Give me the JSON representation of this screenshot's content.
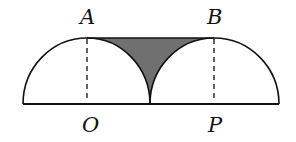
{
  "diagram": {
    "labels": {
      "A": "A",
      "B": "B",
      "O": "O",
      "P": "P"
    },
    "colors": {
      "stroke": "#111111",
      "shaded": "#707070",
      "background": "#ffffff"
    },
    "geometry": {
      "baseline_y": 104,
      "top_y": 38,
      "left_x": 23,
      "O_x": 87,
      "mid_x": 150,
      "P_x": 214,
      "right_x": 279
    }
  }
}
